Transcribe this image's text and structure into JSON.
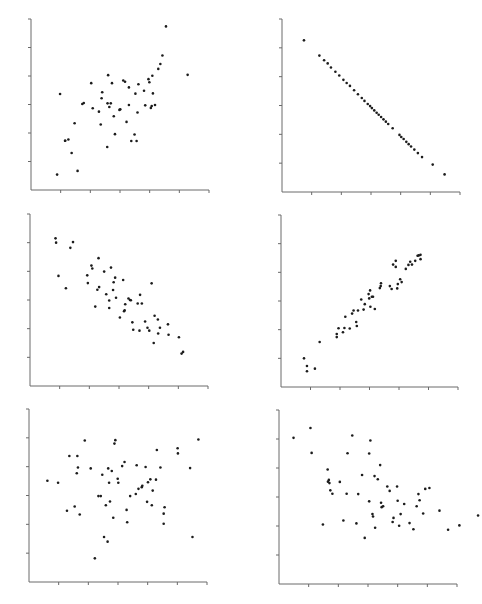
{
  "figure": {
    "title": "",
    "background": "#ffffff",
    "axis_color": "#6a6a6a",
    "point_color": "#1c1c1c"
  },
  "chart_data": [
    {
      "type": "scatter",
      "title": "",
      "xlabel": "",
      "ylabel": "",
      "position": "top-left",
      "grid": false,
      "xlim": [
        0,
        6
      ],
      "ylim": [
        0,
        6
      ],
      "x_ticks": 6,
      "y_ticks": 6,
      "tick_labels": false,
      "correlation_hint": "moderate positive",
      "frame": {
        "ox": 31,
        "oy": 190,
        "w": 178,
        "h": 171
      },
      "points": [
        [
          0.88,
          0.54
        ],
        [
          1.15,
          1.73
        ],
        [
          0.98,
          3.37
        ],
        [
          1.15,
          1.73
        ],
        [
          1.26,
          1.77
        ],
        [
          1.37,
          1.3
        ],
        [
          1.47,
          2.34
        ],
        [
          1.57,
          0.67
        ],
        [
          1.73,
          3.02
        ],
        [
          1.78,
          3.05
        ],
        [
          2.03,
          3.75
        ],
        [
          2.08,
          2.87
        ],
        [
          2.29,
          2.75
        ],
        [
          2.35,
          2.3
        ],
        [
          2.38,
          3.22
        ],
        [
          2.4,
          3.43
        ],
        [
          2.57,
          1.51
        ],
        [
          2.58,
          3.04
        ],
        [
          2.6,
          4.03
        ],
        [
          2.64,
          2.91
        ],
        [
          2.69,
          3.04
        ],
        [
          2.73,
          3.75
        ],
        [
          2.79,
          2.59
        ],
        [
          2.83,
          1.96
        ],
        [
          2.98,
          2.81
        ],
        [
          3.01,
          2.83
        ],
        [
          3.11,
          3.84
        ],
        [
          3.17,
          3.8
        ],
        [
          3.22,
          2.39
        ],
        [
          3.3,
          3.6
        ],
        [
          3.3,
          2.98
        ],
        [
          3.38,
          1.72
        ],
        [
          3.49,
          1.95
        ],
        [
          3.52,
          3.38
        ],
        [
          3.56,
          1.72
        ],
        [
          3.59,
          2.72
        ],
        [
          3.62,
          3.71
        ],
        [
          3.81,
          3.48
        ],
        [
          3.85,
          2.97
        ],
        [
          3.96,
          3.89
        ],
        [
          3.99,
          3.78
        ],
        [
          4.04,
          2.88
        ],
        [
          4.07,
          2.95
        ],
        [
          4.09,
          4.01
        ],
        [
          4.11,
          3.39
        ],
        [
          4.18,
          2.98
        ],
        [
          4.29,
          4.25
        ],
        [
          4.36,
          4.42
        ],
        [
          4.43,
          4.72
        ],
        [
          4.55,
          5.74
        ],
        [
          5.28,
          4.04
        ]
      ]
    },
    {
      "type": "scatter",
      "title": "",
      "xlabel": "",
      "ylabel": "",
      "position": "top-right",
      "grid": false,
      "xlim": [
        0,
        6
      ],
      "ylim": [
        0,
        6
      ],
      "x_ticks": 6,
      "y_ticks": 6,
      "tick_labels": false,
      "correlation_hint": "perfect negative",
      "frame": {
        "ox": 282,
        "oy": 192,
        "w": 178,
        "h": 173
      },
      "points": [
        [
          0.74,
          5.26
        ],
        [
          1.26,
          4.73
        ],
        [
          1.42,
          4.57
        ],
        [
          1.54,
          4.46
        ],
        [
          1.65,
          4.32
        ],
        [
          1.8,
          4.17
        ],
        [
          1.93,
          4.04
        ],
        [
          2.07,
          3.89
        ],
        [
          2.18,
          3.78
        ],
        [
          2.29,
          3.68
        ],
        [
          2.43,
          3.53
        ],
        [
          2.56,
          3.39
        ],
        [
          2.69,
          3.26
        ],
        [
          2.78,
          3.16
        ],
        [
          2.89,
          3.05
        ],
        [
          2.97,
          2.98
        ],
        [
          3.03,
          2.91
        ],
        [
          3.11,
          2.83
        ],
        [
          3.19,
          2.75
        ],
        [
          3.26,
          2.68
        ],
        [
          3.34,
          2.6
        ],
        [
          3.42,
          2.52
        ],
        [
          3.5,
          2.44
        ],
        [
          3.58,
          2.36
        ],
        [
          3.73,
          2.21
        ],
        [
          3.96,
          1.98
        ],
        [
          4.02,
          1.91
        ],
        [
          4.1,
          1.84
        ],
        [
          4.19,
          1.74
        ],
        [
          4.27,
          1.66
        ],
        [
          4.35,
          1.58
        ],
        [
          4.46,
          1.47
        ],
        [
          4.58,
          1.35
        ],
        [
          4.72,
          1.21
        ],
        [
          5.08,
          0.95
        ],
        [
          5.48,
          0.61
        ]
      ]
    },
    {
      "type": "scatter",
      "title": "",
      "xlabel": "",
      "ylabel": "",
      "position": "middle-left",
      "grid": false,
      "xlim": [
        0,
        6
      ],
      "ylim": [
        0,
        6
      ],
      "x_ticks": 6,
      "y_ticks": 6,
      "tick_labels": false,
      "correlation_hint": "moderate negative",
      "frame": {
        "ox": 30,
        "oy": 386,
        "w": 178,
        "h": 172
      },
      "points": [
        [
          0.86,
          5.15
        ],
        [
          0.88,
          5.0
        ],
        [
          1.36,
          4.82
        ],
        [
          1.45,
          5.02
        ],
        [
          0.96,
          3.84
        ],
        [
          1.21,
          3.41
        ],
        [
          1.93,
          3.86
        ],
        [
          1.95,
          3.59
        ],
        [
          2.07,
          4.2
        ],
        [
          2.1,
          4.1
        ],
        [
          2.27,
          3.36
        ],
        [
          2.31,
          4.46
        ],
        [
          2.33,
          3.45
        ],
        [
          2.2,
          2.77
        ],
        [
          2.5,
          3.99
        ],
        [
          2.57,
          3.2
        ],
        [
          2.67,
          2.98
        ],
        [
          2.73,
          4.13
        ],
        [
          2.67,
          2.72
        ],
        [
          2.82,
          3.62
        ],
        [
          2.8,
          3.35
        ],
        [
          2.87,
          3.78
        ],
        [
          2.9,
          3.08
        ],
        [
          3.03,
          2.39
        ],
        [
          3.14,
          3.7
        ],
        [
          3.17,
          2.61
        ],
        [
          3.19,
          2.64
        ],
        [
          3.21,
          2.85
        ],
        [
          3.32,
          3.05
        ],
        [
          3.37,
          3.0
        ],
        [
          3.4,
          2.99
        ],
        [
          3.45,
          2.22
        ],
        [
          3.48,
          1.96
        ],
        [
          3.63,
          2.88
        ],
        [
          3.69,
          1.93
        ],
        [
          3.71,
          3.18
        ],
        [
          3.77,
          2.88
        ],
        [
          3.88,
          2.25
        ],
        [
          3.96,
          2.03
        ],
        [
          4.02,
          1.93
        ],
        [
          4.1,
          3.58
        ],
        [
          4.2,
          2.45
        ],
        [
          4.17,
          1.5
        ],
        [
          4.31,
          2.32
        ],
        [
          4.32,
          1.83
        ],
        [
          4.38,
          2.03
        ],
        [
          4.65,
          2.15
        ],
        [
          4.67,
          1.79
        ],
        [
          5.02,
          1.7
        ],
        [
          5.11,
          1.13
        ],
        [
          5.16,
          1.19
        ]
      ]
    },
    {
      "type": "scatter",
      "title": "",
      "xlabel": "",
      "ylabel": "",
      "position": "middle-right",
      "grid": false,
      "xlim": [
        0,
        6
      ],
      "ylim": [
        0,
        6
      ],
      "x_ticks": 6,
      "y_ticks": 6,
      "tick_labels": false,
      "correlation_hint": "strong positive",
      "frame": {
        "ox": 281,
        "oy": 387,
        "w": 177,
        "h": 172
      },
      "points": [
        [
          0.78,
          1.0
        ],
        [
          0.88,
          0.73
        ],
        [
          0.88,
          0.55
        ],
        [
          1.15,
          0.64
        ],
        [
          1.31,
          1.57
        ],
        [
          1.89,
          1.85
        ],
        [
          1.89,
          1.74
        ],
        [
          1.95,
          2.05
        ],
        [
          2.1,
          1.91
        ],
        [
          2.15,
          2.06
        ],
        [
          2.18,
          2.45
        ],
        [
          2.33,
          2.04
        ],
        [
          2.41,
          2.56
        ],
        [
          2.46,
          2.67
        ],
        [
          2.55,
          2.27
        ],
        [
          2.57,
          2.13
        ],
        [
          2.61,
          2.67
        ],
        [
          2.72,
          3.05
        ],
        [
          2.8,
          2.7
        ],
        [
          2.84,
          2.89
        ],
        [
          2.97,
          3.24
        ],
        [
          2.99,
          3.09
        ],
        [
          3.02,
          3.37
        ],
        [
          3.03,
          2.8
        ],
        [
          3.08,
          3.15
        ],
        [
          3.12,
          3.15
        ],
        [
          3.18,
          2.72
        ],
        [
          3.35,
          3.45
        ],
        [
          3.38,
          3.52
        ],
        [
          3.39,
          3.62
        ],
        [
          3.69,
          3.52
        ],
        [
          3.75,
          3.42
        ],
        [
          3.8,
          4.27
        ],
        [
          3.89,
          4.4
        ],
        [
          3.89,
          4.19
        ],
        [
          3.94,
          3.44
        ],
        [
          3.96,
          3.59
        ],
        [
          4.04,
          3.76
        ],
        [
          4.09,
          3.66
        ],
        [
          4.23,
          4.12
        ],
        [
          4.32,
          4.26
        ],
        [
          4.38,
          4.37
        ],
        [
          4.44,
          4.27
        ],
        [
          4.55,
          4.4
        ],
        [
          4.63,
          4.58
        ],
        [
          4.67,
          4.59
        ],
        [
          4.73,
          4.61
        ],
        [
          4.73,
          4.46
        ]
      ]
    },
    {
      "type": "scatter",
      "title": "",
      "xlabel": "",
      "ylabel": "",
      "position": "bottom-left",
      "grid": false,
      "xlim": [
        0,
        6
      ],
      "ylim": [
        0,
        6
      ],
      "x_ticks": 6,
      "y_ticks": 6,
      "tick_labels": false,
      "correlation_hint": "near zero",
      "frame": {
        "ox": 29,
        "oy": 582,
        "w": 178,
        "h": 173
      },
      "points": [
        [
          0.62,
          3.51
        ],
        [
          0.98,
          3.44
        ],
        [
          1.28,
          2.47
        ],
        [
          1.36,
          4.37
        ],
        [
          1.54,
          2.62
        ],
        [
          1.63,
          4.37
        ],
        [
          1.65,
          3.97
        ],
        [
          1.61,
          3.77
        ],
        [
          1.71,
          2.34
        ],
        [
          1.88,
          4.91
        ],
        [
          2.08,
          3.94
        ],
        [
          2.22,
          0.82
        ],
        [
          2.34,
          2.98
        ],
        [
          2.42,
          2.98
        ],
        [
          2.47,
          3.72
        ],
        [
          2.53,
          1.56
        ],
        [
          2.59,
          2.66
        ],
        [
          2.65,
          1.4
        ],
        [
          2.67,
          3.94
        ],
        [
          2.7,
          3.44
        ],
        [
          2.73,
          2.79
        ],
        [
          2.79,
          3.85
        ],
        [
          2.84,
          2.23
        ],
        [
          2.88,
          4.8
        ],
        [
          2.91,
          4.92
        ],
        [
          2.99,
          3.58
        ],
        [
          3.01,
          3.44
        ],
        [
          3.14,
          4.02
        ],
        [
          3.22,
          4.16
        ],
        [
          3.29,
          2.5
        ],
        [
          3.31,
          2.07
        ],
        [
          3.41,
          2.98
        ],
        [
          3.6,
          3.05
        ],
        [
          3.63,
          4.05
        ],
        [
          3.69,
          3.23
        ],
        [
          3.8,
          3.29
        ],
        [
          3.82,
          3.34
        ],
        [
          3.93,
          3.99
        ],
        [
          3.98,
          2.78
        ],
        [
          4.01,
          3.46
        ],
        [
          4.09,
          3.56
        ],
        [
          4.14,
          2.66
        ],
        [
          4.17,
          3.17
        ],
        [
          4.28,
          3.55
        ],
        [
          4.31,
          4.58
        ],
        [
          4.43,
          3.97
        ],
        [
          4.54,
          2.37
        ],
        [
          4.54,
          2.02
        ],
        [
          4.57,
          2.59
        ],
        [
          5.01,
          4.64
        ],
        [
          5.02,
          4.46
        ],
        [
          5.43,
          3.95
        ],
        [
          5.51,
          1.56
        ],
        [
          5.71,
          4.94
        ]
      ]
    },
    {
      "type": "scatter",
      "title": "",
      "xlabel": "",
      "ylabel": "",
      "position": "bottom-right",
      "grid": false,
      "xlim": [
        0,
        6
      ],
      "ylim": [
        0,
        6
      ],
      "x_ticks": 6,
      "y_ticks": 6,
      "tick_labels": false,
      "correlation_hint": "slight negative",
      "frame": {
        "ox": 279,
        "oy": 584,
        "w": 178,
        "h": 174
      },
      "points": [
        [
          0.49,
          5.04
        ],
        [
          1.06,
          5.38
        ],
        [
          1.1,
          4.52
        ],
        [
          1.48,
          2.05
        ],
        [
          1.64,
          3.95
        ],
        [
          1.65,
          3.53
        ],
        [
          1.68,
          3.59
        ],
        [
          1.7,
          3.48
        ],
        [
          1.73,
          3.23
        ],
        [
          1.8,
          3.11
        ],
        [
          2.05,
          3.52
        ],
        [
          2.17,
          2.19
        ],
        [
          2.28,
          3.11
        ],
        [
          2.31,
          4.51
        ],
        [
          2.47,
          5.12
        ],
        [
          2.61,
          2.09
        ],
        [
          2.67,
          3.1
        ],
        [
          2.8,
          3.76
        ],
        [
          2.89,
          1.59
        ],
        [
          3.04,
          4.5
        ],
        [
          3.04,
          2.85
        ],
        [
          3.08,
          4.95
        ],
        [
          3.15,
          2.41
        ],
        [
          3.17,
          2.33
        ],
        [
          3.22,
          3.72
        ],
        [
          3.24,
          1.94
        ],
        [
          3.33,
          3.61
        ],
        [
          3.41,
          4.1
        ],
        [
          3.44,
          2.8
        ],
        [
          3.46,
          2.65
        ],
        [
          3.51,
          2.68
        ],
        [
          3.65,
          3.36
        ],
        [
          3.73,
          3.21
        ],
        [
          3.83,
          2.14
        ],
        [
          3.86,
          2.28
        ],
        [
          3.98,
          3.36
        ],
        [
          4.0,
          2.87
        ],
        [
          4.05,
          2.01
        ],
        [
          4.1,
          2.41
        ],
        [
          4.22,
          2.76
        ],
        [
          4.4,
          2.1
        ],
        [
          4.53,
          1.89
        ],
        [
          4.64,
          2.68
        ],
        [
          4.7,
          3.1
        ],
        [
          4.74,
          2.89
        ],
        [
          4.86,
          2.43
        ],
        [
          4.93,
          3.28
        ],
        [
          5.07,
          3.31
        ],
        [
          5.41,
          2.53
        ],
        [
          5.7,
          1.87
        ],
        [
          6.08,
          2.02
        ],
        [
          6.71,
          2.36
        ]
      ]
    }
  ]
}
